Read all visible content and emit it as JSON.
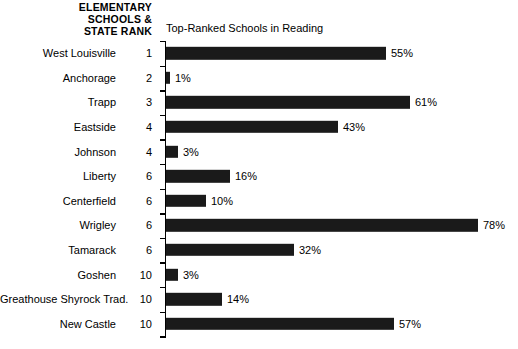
{
  "header": {
    "lines": [
      "ELEMENTARY",
      "SCHOOLS &",
      "STATE RANK"
    ]
  },
  "chart_data": {
    "type": "bar",
    "orientation": "horizontal",
    "title": "Top-Ranked Schools in Reading",
    "xlabel": "",
    "ylabel": "",
    "xlim": [
      0,
      80
    ],
    "grid": false,
    "legend": null,
    "value_suffix": "%",
    "bar_color": "#1a1a1a",
    "categories": [
      "West Louisville",
      "Anchorage",
      "Trapp",
      "Eastside",
      "Johnson",
      "Liberty",
      "Centerfield",
      "Wrigley",
      "Tamarack",
      "Goshen",
      "Greathouse Shyrock Trad.",
      "New Castle"
    ],
    "ranks": [
      "1",
      "2",
      "3",
      "4",
      "4",
      "6",
      "6",
      "6",
      "6",
      "10",
      "10",
      "10"
    ],
    "values": [
      55,
      1,
      61,
      43,
      3,
      16,
      10,
      78,
      32,
      3,
      14,
      57
    ],
    "value_labels": [
      "55%",
      "1%",
      "61%",
      "43%",
      "3%",
      "16%",
      "10%",
      "78%",
      "32%",
      "3%",
      "14%",
      "57%"
    ]
  }
}
